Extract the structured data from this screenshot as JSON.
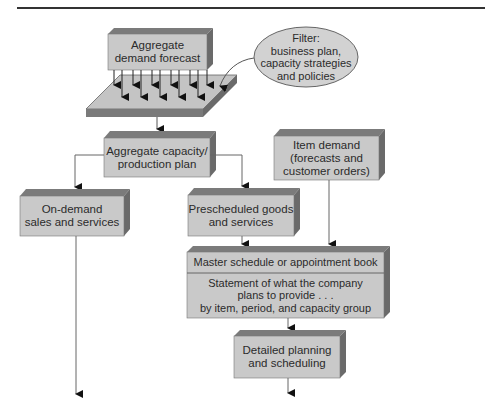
{
  "diagram": {
    "colors": {
      "box_front": "#c9c9c9",
      "box_top": "#7b7b7b",
      "box_side": "#6a6a6a",
      "ellipse_fill": "#d2d2d2",
      "line": "#555555",
      "rule": "#333333"
    },
    "nodes": {
      "aggregate_demand": {
        "lines": [
          "Aggregate",
          "demand forecast"
        ]
      },
      "filter": {
        "lines": [
          "Filter:",
          "business plan,",
          "capacity strategies",
          "and policies"
        ]
      },
      "aggregate_capacity": {
        "lines": [
          "Aggregate capacity/",
          "production plan"
        ]
      },
      "item_demand": {
        "lines": [
          "Item demand",
          "(forecasts and",
          "customer orders)"
        ]
      },
      "on_demand": {
        "lines": [
          "On-demand",
          "sales and services"
        ]
      },
      "prescheduled": {
        "lines": [
          "Prescheduled goods",
          "and services"
        ]
      },
      "master_schedule": {
        "title": "Master schedule or appointment book",
        "lines": [
          "Statement of what the company",
          "plans to provide . . .",
          "by item, period, and capacity group"
        ]
      },
      "detailed_planning": {
        "lines": [
          "Detailed planning",
          "and scheduling"
        ]
      }
    }
  }
}
